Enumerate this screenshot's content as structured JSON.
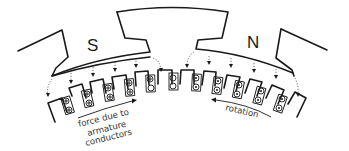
{
  "diagram": {
    "title": "",
    "poles": [
      {
        "id": "south",
        "label": "S"
      },
      {
        "id": "north",
        "label": "N"
      }
    ],
    "annotations": {
      "force": {
        "lines": [
          "force due to",
          "armature",
          "conductors"
        ]
      },
      "rotation": {
        "label": "rotation"
      }
    },
    "conductor_symbols": {
      "dot": "current out of page",
      "cross": "current into page"
    },
    "slots": [
      {
        "index": 1,
        "symbols": [
          "cross",
          "cross"
        ]
      },
      {
        "index": 2,
        "symbols": [
          "cross",
          "cross"
        ]
      },
      {
        "index": 3,
        "symbols": [
          "cross",
          "cross"
        ]
      },
      {
        "index": 4,
        "symbols": [
          "cross",
          "cross"
        ]
      },
      {
        "index": 5,
        "symbols": [
          "cross",
          "cross"
        ]
      },
      {
        "index": 6,
        "symbols": [
          "cross",
          "empty"
        ]
      },
      {
        "index": 7,
        "symbols": [
          "empty",
          "empty"
        ]
      },
      {
        "index": 8,
        "symbols": [
          "dot",
          "dot"
        ]
      },
      {
        "index": 9,
        "symbols": [
          "dot",
          "dot"
        ]
      },
      {
        "index": 10,
        "symbols": [
          "dot",
          "dot"
        ]
      },
      {
        "index": 11,
        "symbols": [
          "dot",
          "dot"
        ]
      },
      {
        "index": 12,
        "symbols": [
          "dot",
          "dot"
        ]
      }
    ]
  }
}
